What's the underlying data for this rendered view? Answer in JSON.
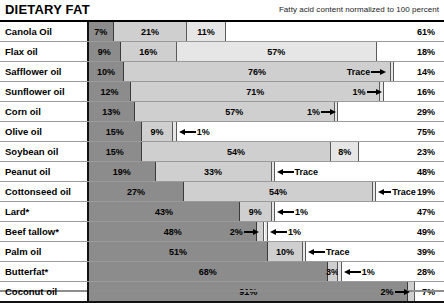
{
  "header": {
    "title": "DIETARY FAT",
    "note": "Fatty acid content normalized to 100 percent"
  },
  "chart_data": {
    "type": "bar",
    "subtype": "stacked-horizontal-100pct",
    "title": "DIETARY FAT",
    "subtitle": "Fatty acid content normalized to 100 percent",
    "xlabel": "",
    "ylabel": "",
    "xlim": [
      0,
      100
    ],
    "grid": false,
    "legend_position": "none",
    "units": "percent",
    "categories": [
      "Canola Oil",
      "Flax oil",
      "Safflower oil",
      "Sunflower oil",
      "Corn oil",
      "Olive oil",
      "Soybean oil",
      "Peanut oil",
      "Cottonseed oil",
      "Lard*",
      "Beef tallow*",
      "Palm oil",
      "Butterfat*",
      "Coconut oil"
    ],
    "series": [
      {
        "name": "segment-1",
        "shade": "#8c8c8c",
        "values": [
          7,
          9,
          10,
          12,
          13,
          15,
          15,
          19,
          27,
          43,
          48,
          51,
          68,
          91
        ]
      },
      {
        "name": "segment-2",
        "shade": "#cfcfcf",
        "values": [
          21,
          16,
          76,
          71,
          57,
          9,
          54,
          33,
          54,
          9,
          2,
          10,
          3,
          2
        ]
      },
      {
        "name": "segment-3",
        "shade": "#e6e6e6",
        "values": [
          11,
          57,
          0,
          1,
          1,
          1,
          8,
          0,
          0,
          1,
          1,
          0,
          1,
          0
        ]
      },
      {
        "name": "segment-4",
        "shade": "#ffffff",
        "values": [
          61,
          18,
          14,
          16,
          29,
          75,
          23,
          48,
          19,
          47,
          49,
          39,
          28,
          7
        ]
      }
    ]
  },
  "rows": [
    {
      "label": "Canola Oil",
      "segments": [
        {
          "value": "7%",
          "pct": 7,
          "shade": 0,
          "align": "center",
          "callout": null
        },
        {
          "value": "21%",
          "pct": 21,
          "shade": 1,
          "align": "center",
          "callout": null
        },
        {
          "value": "11%",
          "pct": 11,
          "shade": 2,
          "align": "center",
          "callout": null
        },
        {
          "value": "61%",
          "pct": 61,
          "shade": 3,
          "align": "right",
          "callout": null
        }
      ]
    },
    {
      "label": "Flax oil",
      "segments": [
        {
          "value": "9%",
          "pct": 9,
          "shade": 0,
          "align": "center",
          "callout": null
        },
        {
          "value": "16%",
          "pct": 16,
          "shade": 1,
          "align": "center",
          "callout": null
        },
        {
          "value": "57%",
          "pct": 57,
          "shade": 2,
          "align": "center",
          "callout": null
        },
        {
          "value": "18%",
          "pct": 18,
          "shade": 3,
          "align": "right",
          "callout": null
        }
      ]
    },
    {
      "label": "Safflower oil",
      "segments": [
        {
          "value": "10%",
          "pct": 10,
          "shade": 0,
          "align": "center",
          "callout": null
        },
        {
          "value": "76%",
          "pct": 76,
          "shade": 1,
          "align": "center",
          "callout": null
        },
        {
          "value": "Trace",
          "pct": 0.6,
          "shade": 2,
          "align": "sliver",
          "callout": "left"
        },
        {
          "value": "14%",
          "pct": 13.4,
          "shade": 3,
          "align": "right",
          "callout": null
        }
      ]
    },
    {
      "label": "Sunflower oil",
      "segments": [
        {
          "value": "12%",
          "pct": 12,
          "shade": 0,
          "align": "center",
          "callout": null
        },
        {
          "value": "71%",
          "pct": 71,
          "shade": 1,
          "align": "center",
          "callout": null
        },
        {
          "value": "1%",
          "pct": 1,
          "shade": 2,
          "align": "sliver",
          "callout": "left"
        },
        {
          "value": "16%",
          "pct": 16,
          "shade": 3,
          "align": "right",
          "callout": null
        }
      ]
    },
    {
      "label": "Corn oil",
      "segments": [
        {
          "value": "13%",
          "pct": 13,
          "shade": 0,
          "align": "center",
          "callout": null
        },
        {
          "value": "57%",
          "pct": 57,
          "shade": 1,
          "align": "center",
          "callout": null
        },
        {
          "value": "1%",
          "pct": 1,
          "shade": 2,
          "align": "sliver",
          "callout": "left"
        },
        {
          "value": "29%",
          "pct": 29,
          "shade": 3,
          "align": "right",
          "callout": null
        }
      ]
    },
    {
      "label": "Olive oil",
      "segments": [
        {
          "value": "15%",
          "pct": 15,
          "shade": 0,
          "align": "center",
          "callout": null
        },
        {
          "value": "9%",
          "pct": 9,
          "shade": 1,
          "align": "center",
          "callout": null
        },
        {
          "value": "1%",
          "pct": 1,
          "shade": 2,
          "align": "sliver",
          "callout": "right"
        },
        {
          "value": "75%",
          "pct": 75,
          "shade": 3,
          "align": "right",
          "callout": null
        }
      ]
    },
    {
      "label": "Soybean oil",
      "segments": [
        {
          "value": "15%",
          "pct": 15,
          "shade": 0,
          "align": "center",
          "callout": null
        },
        {
          "value": "54%",
          "pct": 54,
          "shade": 1,
          "align": "center",
          "callout": null
        },
        {
          "value": "8%",
          "pct": 8,
          "shade": 2,
          "align": "center",
          "callout": null
        },
        {
          "value": "23%",
          "pct": 23,
          "shade": 3,
          "align": "right",
          "callout": null
        }
      ]
    },
    {
      "label": "Peanut oil",
      "segments": [
        {
          "value": "19%",
          "pct": 19,
          "shade": 0,
          "align": "center",
          "callout": null
        },
        {
          "value": "33%",
          "pct": 33,
          "shade": 1,
          "align": "center",
          "callout": null
        },
        {
          "value": "Trace",
          "pct": 0.5,
          "shade": 2,
          "align": "sliver",
          "callout": "right"
        },
        {
          "value": "48%",
          "pct": 47.5,
          "shade": 3,
          "align": "right",
          "callout": null
        }
      ]
    },
    {
      "label": "Cottonseed oil",
      "segments": [
        {
          "value": "27%",
          "pct": 27,
          "shade": 0,
          "align": "center",
          "callout": null
        },
        {
          "value": "54%",
          "pct": 54,
          "shade": 1,
          "align": "center",
          "callout": null
        },
        {
          "value": "Trace",
          "pct": 0.5,
          "shade": 2,
          "align": "sliver",
          "callout": "right-tight"
        },
        {
          "value": "19%",
          "pct": 18.5,
          "shade": 3,
          "align": "right",
          "callout": null
        }
      ]
    },
    {
      "label": "Lard*",
      "segments": [
        {
          "value": "43%",
          "pct": 43,
          "shade": 0,
          "align": "center",
          "callout": null
        },
        {
          "value": "9%",
          "pct": 9,
          "shade": 1,
          "align": "center",
          "callout": null
        },
        {
          "value": "1%",
          "pct": 1,
          "shade": 2,
          "align": "sliver",
          "callout": "right"
        },
        {
          "value": "47%",
          "pct": 47,
          "shade": 3,
          "align": "right",
          "callout": null
        }
      ]
    },
    {
      "label": "Beef tallow*",
      "segments": [
        {
          "value": "48%",
          "pct": 48,
          "shade": 0,
          "align": "center",
          "callout": null
        },
        {
          "value": "2%",
          "pct": 2,
          "shade": 1,
          "align": "sliver",
          "callout": "left"
        },
        {
          "value": "1%",
          "pct": 1,
          "shade": 2,
          "align": "sliver",
          "callout": "right"
        },
        {
          "value": "49%",
          "pct": 49,
          "shade": 3,
          "align": "right",
          "callout": null
        }
      ]
    },
    {
      "label": "Palm oil",
      "segments": [
        {
          "value": "51%",
          "pct": 51,
          "shade": 0,
          "align": "center",
          "callout": null
        },
        {
          "value": "10%",
          "pct": 10,
          "shade": 1,
          "align": "center",
          "callout": null
        },
        {
          "value": "Trace",
          "pct": 0.5,
          "shade": 2,
          "align": "sliver",
          "callout": "right"
        },
        {
          "value": "39%",
          "pct": 38.5,
          "shade": 3,
          "align": "right",
          "callout": null
        }
      ]
    },
    {
      "label": "Butterfat*",
      "segments": [
        {
          "value": "68%",
          "pct": 68,
          "shade": 0,
          "align": "center",
          "callout": null
        },
        {
          "value": "3%",
          "pct": 3,
          "shade": 1,
          "align": "center",
          "callout": null
        },
        {
          "value": "1%",
          "pct": 1,
          "shade": 2,
          "align": "sliver",
          "callout": "right"
        },
        {
          "value": "28%",
          "pct": 28,
          "shade": 3,
          "align": "right",
          "callout": null
        }
      ]
    },
    {
      "label": "Coconut oil",
      "segments": [
        {
          "value": "91%",
          "pct": 91,
          "shade": 0,
          "align": "center",
          "callout": null
        },
        {
          "value": "2%",
          "pct": 2,
          "shade": 1,
          "align": "sliver",
          "callout": "left"
        },
        {
          "value": "7%",
          "pct": 7,
          "shade": 3,
          "align": "right",
          "callout": null
        }
      ]
    }
  ]
}
